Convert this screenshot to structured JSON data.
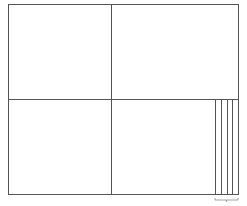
{
  "diagram": {
    "type": "grid-layout-sketch",
    "stroke_color": "#555555",
    "bracket_color": "#8a8a8a",
    "outer_frame": {
      "x1": 8,
      "y1": 4,
      "x2": 238,
      "y2": 194
    },
    "center": {
      "x": 111,
      "y": 99
    },
    "quadrants": [
      "top-left",
      "top-right",
      "bottom-left",
      "bottom-right"
    ],
    "strip_lines_x": [
      215,
      221,
      227,
      232
    ],
    "strip_region": {
      "y1": 99,
      "y2": 194
    },
    "bracket": {
      "x1": 215,
      "x2": 238,
      "y": 200
    }
  }
}
